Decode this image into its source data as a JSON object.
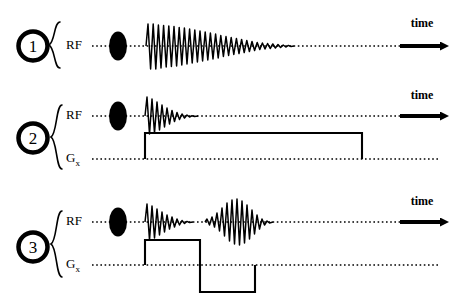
{
  "figure": {
    "background": "#ffffff",
    "ink": "#000000",
    "width": 458,
    "height": 304
  },
  "rows": [
    {
      "number": "1",
      "number_icon": "circled-number-icon",
      "brace_icon": "curly-brace-icon",
      "channels": [
        {
          "name": "RF",
          "label": "RF",
          "label_sub": ""
        }
      ],
      "time_label": "time",
      "time_arrow_icon": "right-arrow-icon",
      "rf_pulse_icon": "filled-ellipse-icon",
      "signal": "free-induction-decay-long"
    },
    {
      "number": "2",
      "number_icon": "circled-number-icon",
      "brace_icon": "curly-brace-icon",
      "channels": [
        {
          "name": "RF",
          "label": "RF",
          "label_sub": ""
        },
        {
          "name": "Gx",
          "label": "G",
          "label_sub": "x"
        }
      ],
      "time_label": "time",
      "time_arrow_icon": "right-arrow-icon",
      "rf_pulse_icon": "filled-ellipse-icon",
      "signal": "free-induction-decay-short",
      "gradient": "single-positive-lobe"
    },
    {
      "number": "3",
      "number_icon": "circled-number-icon",
      "brace_icon": "curly-brace-icon",
      "channels": [
        {
          "name": "RF",
          "label": "RF",
          "label_sub": ""
        },
        {
          "name": "Gx",
          "label": "G",
          "label_sub": "x"
        }
      ],
      "time_label": "time",
      "time_arrow_icon": "right-arrow-icon",
      "rf_pulse_icon": "filled-ellipse-icon",
      "signal": "free-induction-decay-plus-gradient-echo",
      "gradient": "bipolar-lobes"
    }
  ]
}
